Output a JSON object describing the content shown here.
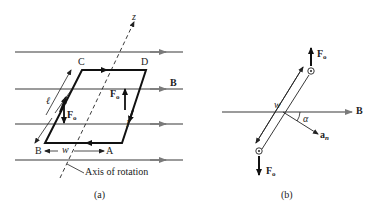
{
  "figure_a": {
    "caption": "(a)",
    "field_label": "B",
    "axis_label": "z",
    "axis_of_rotation_label": "Axis of rotation",
    "corners": {
      "A": "A",
      "B": "B",
      "C": "C",
      "D": "D"
    },
    "length_label": "ℓ",
    "width_label": "w",
    "current_label": "I",
    "force_label": "F",
    "force_sub": "o"
  },
  "figure_b": {
    "caption": "(b)",
    "field_label": "B",
    "width_label": "w",
    "angle_label": "α",
    "normal_label": "a",
    "normal_sub": "n",
    "force_label": "F",
    "force_sub": "o"
  },
  "colors": {
    "field_line": "#7a7a7a",
    "loop": "#111111",
    "text": "#222222"
  }
}
